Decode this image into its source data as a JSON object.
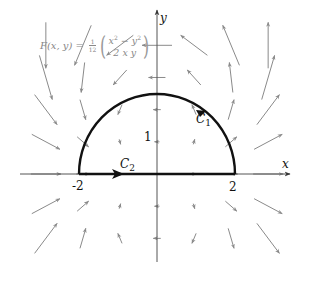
{
  "diagram": {
    "formula": {
      "lhs": "F(x, y)",
      "equals": "=",
      "coef_num": "1",
      "coef_den": "12",
      "component_1_base_x": "x",
      "component_1_minus_y": " − y",
      "exp": "2",
      "component_2": "2 x y"
    },
    "axes": {
      "x_label": "x",
      "y_label": "y",
      "tick_neg2": "-2",
      "tick_pos2": "2",
      "tick_1": "1"
    },
    "curves": {
      "c1_label": "C",
      "c1_sub": "1",
      "c2_label": "C",
      "c2_sub": "2"
    },
    "geometry": {
      "origin_px": [
        157,
        174
      ],
      "scale_px_per_unit": 39,
      "semicircle_radius": 2
    },
    "colors": {
      "curve": "#111111",
      "axis": "#555555",
      "field_arrow": "#8a8a8a",
      "formula_text": "#888888"
    }
  }
}
